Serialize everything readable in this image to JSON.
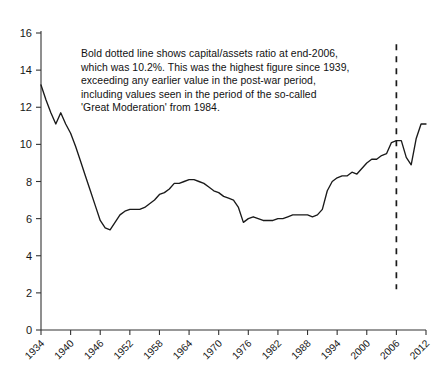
{
  "chart_data": {
    "type": "line",
    "title": "",
    "subtitle": "",
    "xlabel": "",
    "ylabel": "",
    "xlim": [
      1934,
      2012
    ],
    "ylim": [
      0,
      16
    ],
    "grid": false,
    "legend": "none",
    "y_ticks": [
      0,
      2,
      4,
      6,
      8,
      10,
      12,
      14,
      16
    ],
    "x_ticks": [
      1934,
      1940,
      1946,
      1952,
      1958,
      1964,
      1970,
      1976,
      1982,
      1988,
      1994,
      2000,
      2006,
      2012
    ],
    "x_tick_labels": [
      "1934",
      "1940",
      "1946",
      "1952",
      "1958",
      "1964",
      "1970",
      "1976",
      "1982",
      "1988",
      "1994",
      "2000",
      "2006",
      "2012"
    ],
    "y_tick_labels": [
      "0",
      "2",
      "4",
      "6",
      "8",
      "10",
      "12",
      "14",
      "16"
    ],
    "series": [
      {
        "name": "capital/assets ratio",
        "color": "#1a1a1a",
        "x": [
          1934,
          1935,
          1936,
          1937,
          1938,
          1939,
          1940,
          1941,
          1942,
          1943,
          1944,
          1945,
          1946,
          1947,
          1948,
          1949,
          1950,
          1951,
          1952,
          1953,
          1954,
          1955,
          1956,
          1957,
          1958,
          1959,
          1960,
          1961,
          1962,
          1963,
          1964,
          1965,
          1966,
          1967,
          1968,
          1969,
          1970,
          1971,
          1972,
          1973,
          1974,
          1975,
          1976,
          1977,
          1978,
          1979,
          1980,
          1981,
          1982,
          1983,
          1984,
          1985,
          1986,
          1987,
          1988,
          1989,
          1990,
          1991,
          1992,
          1993,
          1994,
          1995,
          1996,
          1997,
          1998,
          1999,
          2000,
          2001,
          2002,
          2003,
          2004,
          2005,
          2006,
          2007,
          2008,
          2009,
          2010,
          2011,
          2012
        ],
        "values": [
          13.2,
          12.4,
          11.7,
          11.1,
          11.7,
          11.1,
          10.6,
          9.9,
          9.1,
          8.3,
          7.5,
          6.7,
          5.9,
          5.5,
          5.4,
          5.8,
          6.2,
          6.4,
          6.5,
          6.5,
          6.5,
          6.6,
          6.8,
          7.0,
          7.3,
          7.4,
          7.6,
          7.9,
          7.9,
          8.0,
          8.1,
          8.1,
          8.0,
          7.9,
          7.7,
          7.5,
          7.4,
          7.2,
          7.1,
          7.0,
          6.6,
          5.8,
          6.0,
          6.1,
          6.0,
          5.9,
          5.9,
          5.9,
          6.0,
          6.0,
          6.1,
          6.2,
          6.2,
          6.2,
          6.2,
          6.1,
          6.2,
          6.5,
          7.5,
          8.0,
          8.2,
          8.3,
          8.3,
          8.5,
          8.4,
          8.7,
          9.0,
          9.2,
          9.2,
          9.4,
          9.5,
          10.1,
          10.2,
          10.2,
          9.3,
          8.9,
          10.3,
          11.1,
          11.1
        ]
      }
    ],
    "annotations": [
      {
        "name": "capital-assets-note",
        "text": "Bold dotted line shows capital/assets ratio at end-2006,\nwhich was 10.2%. This was the highest figure since 1939,\nexceeding any earlier value in the post-war period,\nincluding values seen in the period of the so-called\n'Great Moderation' from 1984."
      }
    ],
    "reference_lines": [
      {
        "name": "year-2006-marker",
        "orientation": "vertical",
        "x": 2006,
        "style": "dashed",
        "color": "#1a1a1a",
        "y_from": 2.2,
        "y_to": 15.4
      }
    ]
  }
}
